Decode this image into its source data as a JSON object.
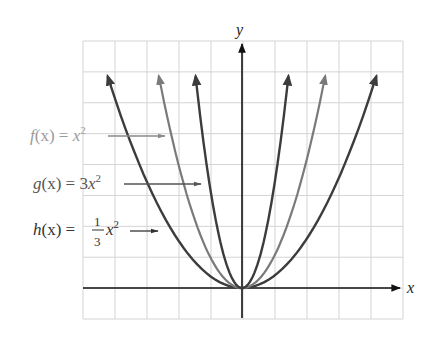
{
  "chart_data": {
    "type": "line",
    "title": "",
    "xlabel": "x",
    "ylabel": "y",
    "grid": true,
    "tick_labels": false,
    "grid_units": {
      "x_cells": 10,
      "y_cells": 9,
      "x_range": [
        -5,
        5
      ],
      "y_range": [
        -1,
        8
      ]
    },
    "series": [
      {
        "name": "f(x) = x^2",
        "expr": "x^2",
        "coefficient": 1,
        "color": "#7a7a7a",
        "label_color": "#9a9a9a",
        "x_extent": [
          -2.6,
          2.6
        ]
      },
      {
        "name": "g(x) = 3x^2",
        "expr": "3x^2",
        "coefficient": 3,
        "color": "#3c3c3c",
        "label_color": "#555555",
        "x_extent": [
          -1.45,
          1.45
        ]
      },
      {
        "name": "h(x) = 1/3 x^2",
        "expr": "(1/3)x^2",
        "coefficient": 0.3333,
        "color": "#3c3c3c",
        "label_color": "#333333",
        "x_extent": [
          -4.2,
          4.2
        ]
      }
    ],
    "annotations": [
      {
        "text": "f(x) = x^2",
        "arrow_to": "f curve, left branch"
      },
      {
        "text": "g(x) = 3x^2",
        "arrow_to": "g curve, left branch"
      },
      {
        "text": "h(x) = 1/3 x^2",
        "arrow_to": "h curve, left branch"
      }
    ]
  },
  "labels": {
    "x_axis": "x",
    "y_axis": "y",
    "f": {
      "name": "f",
      "arg": "(x)",
      "eq": " = ",
      "body": "x",
      "exp": "2"
    },
    "g": {
      "name": "g",
      "arg": "(x)",
      "eq": " = ",
      "coef": "3",
      "body": "x",
      "exp": "2"
    },
    "h": {
      "name": "h",
      "arg": "(x)",
      "eq": " = ",
      "num": "1",
      "den": "3",
      "body": "x",
      "exp": "2"
    }
  }
}
